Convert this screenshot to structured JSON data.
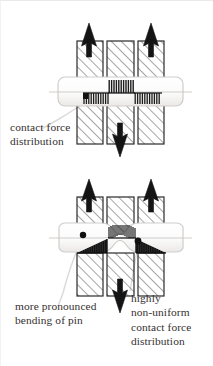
{
  "figure": {
    "background_color": "#ffffff",
    "ink_color": "#1a1a1a",
    "hatch_color": "#4a4a4a",
    "leader_color": "#d8d5d2"
  },
  "captions": {
    "contact_force": {
      "line1": "contact force",
      "line2": "distribution"
    },
    "bending": {
      "line1": "more pronounced",
      "line2": "bending of pin"
    },
    "nonuniform": {
      "line1": "highly",
      "line2": "non-uniform",
      "line3": "contact force",
      "line4": "distribution"
    }
  },
  "top_diagram": {
    "name": "rigid-pin-uniform-contact",
    "arrows": [
      {
        "id": "up-left",
        "direction": "up",
        "x": 88,
        "tip_y": 22
      },
      {
        "id": "up-right",
        "direction": "up",
        "x": 150,
        "tip_y": 22
      },
      {
        "id": "down-center",
        "direction": "down",
        "x": 119,
        "tip_y": 156
      }
    ],
    "lugs": [
      {
        "id": "outer-left",
        "x": 76,
        "y": 40,
        "w": 26,
        "h": 43,
        "part": "upper"
      },
      {
        "id": "center-upper",
        "x": 106,
        "y": 40,
        "w": 27,
        "h": 43,
        "part": "upper"
      },
      {
        "id": "outer-right",
        "x": 137,
        "y": 40,
        "w": 26,
        "h": 43,
        "part": "upper"
      },
      {
        "id": "outer-left-lower",
        "x": 76,
        "y": 103,
        "w": 26,
        "h": 40,
        "part": "lower"
      },
      {
        "id": "center-lower",
        "x": 106,
        "y": 103,
        "w": 27,
        "h": 40,
        "part": "lower"
      },
      {
        "id": "outer-right-lower",
        "x": 137,
        "y": 103,
        "w": 26,
        "h": 40,
        "part": "lower"
      }
    ],
    "pin": {
      "x": 57,
      "y": 76,
      "w": 125,
      "h": 29,
      "straight": true,
      "centerline_y": 91
    },
    "force_combs": [
      {
        "id": "left-comb",
        "x": 82,
        "y": 92,
        "w": 26,
        "h": 11,
        "profile": "uniform",
        "teeth": 11
      },
      {
        "id": "center-comb",
        "x": 107,
        "y": 79,
        "w": 26,
        "h": 13,
        "profile": "uniform",
        "teeth": 11
      },
      {
        "id": "right-comb",
        "x": 133,
        "y": 92,
        "w": 27,
        "h": 11,
        "profile": "uniform",
        "teeth": 11
      }
    ],
    "markers": [
      {
        "id": "left-contact-dot",
        "cx": 85,
        "cy": 96,
        "r": 2.6
      }
    ]
  },
  "bottom_diagram": {
    "name": "flexible-pin-nonuniform-contact",
    "arrows": [
      {
        "id": "up-left",
        "direction": "up",
        "x": 88,
        "tip_y": 178
      },
      {
        "id": "up-right",
        "direction": "up",
        "x": 150,
        "tip_y": 178
      },
      {
        "id": "down-center",
        "direction": "down",
        "x": 119,
        "tip_y": 312
      }
    ],
    "lugs": [
      {
        "id": "outer-left",
        "x": 76,
        "y": 196,
        "w": 26,
        "h": 42,
        "part": "upper"
      },
      {
        "id": "center-upper",
        "x": 106,
        "y": 196,
        "w": 27,
        "h": 42,
        "part": "upper"
      },
      {
        "id": "outer-right",
        "x": 137,
        "y": 196,
        "w": 26,
        "h": 42,
        "part": "upper"
      },
      {
        "id": "outer-left-lower",
        "x": 76,
        "y": 252,
        "w": 26,
        "h": 43,
        "part": "lower"
      },
      {
        "id": "center-lower",
        "x": 106,
        "y": 252,
        "w": 27,
        "h": 43,
        "part": "lower"
      },
      {
        "id": "outer-right-lower",
        "x": 137,
        "y": 252,
        "w": 26,
        "h": 43,
        "part": "lower"
      }
    ],
    "pin": {
      "x": 57,
      "y": 222,
      "w": 125,
      "h": 29,
      "straight": false,
      "bent": true,
      "centerline_y": 237
    },
    "force_combs": [
      {
        "id": "left-comb",
        "x": 76,
        "y": 238,
        "w": 30,
        "h": 14,
        "profile": "triangular",
        "peak": "right",
        "teeth": 13
      },
      {
        "id": "center-comb",
        "x": 107,
        "y": 224,
        "w": 28,
        "h": 13,
        "profile": "uniform",
        "teeth": 14
      },
      {
        "id": "right-comb",
        "x": 135,
        "y": 238,
        "w": 30,
        "h": 13,
        "profile": "triangular",
        "peak": "left",
        "teeth": 13
      }
    ],
    "markers": [
      {
        "id": "left-contact-dot",
        "cx": 82,
        "cy": 234,
        "r": 3.2
      },
      {
        "id": "right-contact-dot",
        "cx": 137,
        "cy": 240,
        "r": 3.4
      }
    ]
  }
}
